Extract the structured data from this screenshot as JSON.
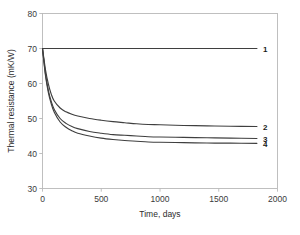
{
  "chart_data": {
    "type": "line",
    "title": "",
    "xlabel": "Time, days",
    "ylabel": "Thermal resistance (mK/W)",
    "xlim": [
      0,
      2000
    ],
    "ylim": [
      30,
      80
    ],
    "xticks": [
      "0",
      "500",
      "1000",
      "1500",
      "2000"
    ],
    "xtick_values": [
      0,
      500,
      1000,
      1500,
      2000
    ],
    "yticks": [
      "30",
      "40",
      "50",
      "60",
      "70",
      "80"
    ],
    "ytick_values": [
      30,
      40,
      50,
      60,
      70,
      80
    ],
    "grid": false,
    "legend_position": "right-of-line-ends",
    "line_color": "#3f3f3f",
    "frame_color": "#b9b9b9",
    "x": [
      0,
      25,
      50,
      75,
      100,
      150,
      200,
      250,
      300,
      400,
      500,
      600,
      700,
      800,
      900,
      1000,
      1200,
      1400,
      1600,
      1825
    ],
    "series": [
      {
        "name": "1",
        "label": "1",
        "values": [
          70.0,
          70.0,
          70.0,
          70.0,
          70.0,
          70.0,
          70.0,
          70.0,
          70.0,
          70.0,
          70.0,
          70.0,
          70.0,
          70.0,
          70.0,
          70.0,
          70.0,
          70.0,
          70.0,
          70.0
        ]
      },
      {
        "name": "2",
        "label": "2",
        "values": [
          70.0,
          64.0,
          59.8,
          56.9,
          55.0,
          53.0,
          51.9,
          51.2,
          50.7,
          50.0,
          49.5,
          49.1,
          48.8,
          48.5,
          48.3,
          48.2,
          48.0,
          47.9,
          47.8,
          47.7
        ]
      },
      {
        "name": "3",
        "label": "3",
        "values": [
          70.0,
          62.8,
          58.0,
          54.8,
          52.6,
          50.0,
          48.6,
          47.7,
          47.1,
          46.3,
          45.8,
          45.4,
          45.2,
          45.0,
          44.8,
          44.7,
          44.6,
          44.5,
          44.4,
          44.3
        ]
      },
      {
        "name": "4",
        "label": "4",
        "values": [
          70.0,
          62.4,
          57.4,
          54.1,
          51.8,
          49.0,
          47.5,
          46.5,
          45.8,
          45.0,
          44.4,
          44.0,
          43.7,
          43.5,
          43.3,
          43.2,
          43.1,
          43.0,
          42.95,
          42.9
        ]
      }
    ]
  }
}
